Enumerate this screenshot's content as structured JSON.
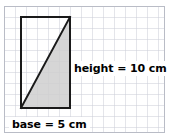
{
  "figure": {
    "background_color": "#ffffff",
    "width": 170,
    "height": 137
  },
  "grid": {
    "cell_size": 11,
    "line_color": "#c9ccd6",
    "border_color": "#b9bcc6",
    "origin_x": 4,
    "origin_y": 6,
    "columns": 15,
    "rows": 12
  },
  "shapes": {
    "rectangle": {
      "name": "rectangle",
      "x": 21,
      "y": 17,
      "width": 49,
      "height": 91,
      "stroke_color": "#1a1a1a",
      "stroke_width": 2,
      "fill": "none"
    },
    "triangle": {
      "name": "shaded-right-triangle",
      "points": "21,108 70,108 70,17",
      "fill_color": "#cfcfcf",
      "fill_opacity": 0.85,
      "stroke_color": "none"
    },
    "hypotenuse": {
      "name": "triangle-hypotenuse",
      "x1": 21,
      "y1": 108,
      "x2": 70,
      "y2": 17,
      "stroke_color": "#1a1a1a",
      "stroke_width": 2
    }
  },
  "labels": {
    "height": {
      "text": "height = 10 cm",
      "value": 10,
      "unit": "cm",
      "quantity": "height"
    },
    "base": {
      "text": "base = 5 cm",
      "value": 5,
      "unit": "cm",
      "quantity": "base"
    }
  }
}
